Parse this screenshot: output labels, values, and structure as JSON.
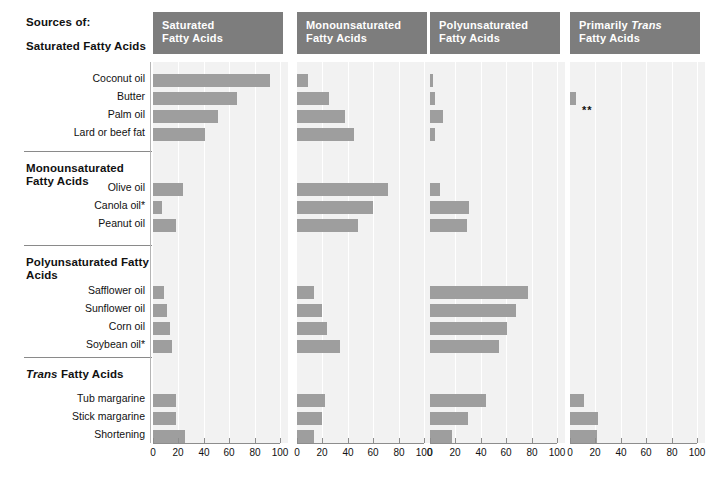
{
  "header": {
    "sources_of": "Sources of:"
  },
  "groups": [
    {
      "name": "Saturated Fatty Acids",
      "italic_prefix": ""
    },
    {
      "name": "Monounsaturated Fatty Acids",
      "italic_prefix": ""
    },
    {
      "name": "Polyunsaturated Fatty Acids",
      "italic_prefix": ""
    },
    {
      "name": "Fatty Acids",
      "italic_prefix": "Trans"
    }
  ],
  "annotation": "**",
  "chart_data": {
    "type": "bar",
    "xlabel": "",
    "ylabel": "",
    "xlim": [
      0,
      100
    ],
    "xticks": [
      0,
      20,
      40,
      60,
      80,
      100
    ],
    "grid": true,
    "legend": "none",
    "orientation": "horizontal",
    "panels": [
      "Saturated Fatty Acids",
      "Monounsaturated Fatty Acids",
      "Polyunsaturated Fatty Acids",
      "Primarily Trans Fatty Acids"
    ],
    "panel_titles": [
      {
        "line1": "Saturated",
        "line2": "Fatty Acids",
        "italic_word": ""
      },
      {
        "line1": "Monounsaturated",
        "line2": "Fatty Acids",
        "italic_word": ""
      },
      {
        "line1": "Polyunsaturated",
        "line2": "Fatty Acids",
        "italic_word": ""
      },
      {
        "line1": "Primarily Trans",
        "line2": "Fatty Acids",
        "italic_word": "Trans"
      }
    ],
    "categories": [
      "Coconut oil",
      "Butter",
      "Palm oil",
      "Lard or beef fat",
      "Olive oil",
      "Canola oil*",
      "Peanut oil",
      "Safflower oil",
      "Sunflower oil",
      "Corn oil",
      "Soybean oil*",
      "Tub margarine",
      "Stick margarine",
      "Shortening"
    ],
    "category_groups": [
      "Saturated Fatty Acids",
      "Saturated Fatty Acids",
      "Saturated Fatty Acids",
      "Saturated Fatty Acids",
      "Monounsaturated Fatty Acids",
      "Monounsaturated Fatty Acids",
      "Monounsaturated Fatty Acids",
      "Polyunsaturated Fatty Acids",
      "Polyunsaturated Fatty Acids",
      "Polyunsaturated Fatty Acids",
      "Polyunsaturated Fatty Acids",
      "Trans Fatty Acids",
      "Trans Fatty Acids",
      "Trans Fatty Acids"
    ],
    "series": [
      {
        "name": "Saturated Fatty Acids",
        "values": [
          92,
          66,
          51,
          41,
          24,
          7,
          18,
          9,
          11,
          13,
          15,
          18,
          18,
          25
        ]
      },
      {
        "name": "Monounsaturated Fatty Acids",
        "values": [
          9,
          25,
          38,
          45,
          72,
          60,
          48,
          13,
          20,
          24,
          34,
          22,
          20,
          13
        ]
      },
      {
        "name": "Polyunsaturated Fatty Acids",
        "values": [
          2,
          4,
          10,
          4,
          8,
          31,
          29,
          77,
          68,
          61,
          54,
          44,
          30,
          17
        ]
      },
      {
        "name": "Primarily Trans Fatty Acids",
        "values": [
          0,
          5,
          0,
          0,
          0,
          0,
          0,
          0,
          0,
          0,
          0,
          11,
          22,
          21
        ]
      }
    ]
  }
}
